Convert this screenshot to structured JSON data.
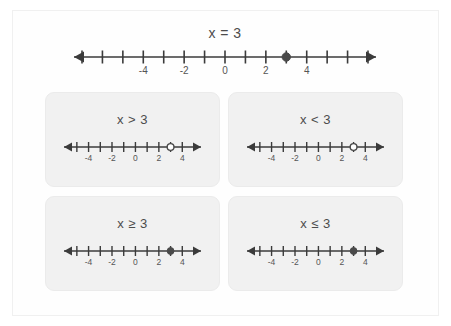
{
  "figure": {
    "title_equation": "x = 3",
    "background_color": "#ffffff",
    "frame_border_color": "#f0f0f0",
    "card_background_color": "#f1f1f1",
    "line_color": "#3b3b3b",
    "label_color": "#4c4c4c",
    "marker_fill_color": "#4a4a4a"
  },
  "chart_data": {
    "type": "line",
    "title": "x = 3",
    "xlabel": "",
    "ylabel": "",
    "plots": [
      {
        "id": "main-number-line",
        "label": "x = 3",
        "relation": "=",
        "value": 3,
        "xlim": [
          -7,
          7
        ],
        "ticks": [
          -7,
          -6,
          -5,
          -4,
          -3,
          -2,
          -1,
          0,
          1,
          2,
          3,
          4,
          5,
          6,
          7
        ],
        "tick_labels": [
          {
            "value": -4,
            "text": "-4"
          },
          {
            "value": -2,
            "text": "-2"
          },
          {
            "value": 0,
            "text": "0"
          },
          {
            "value": 2,
            "text": "2"
          },
          {
            "value": 4,
            "text": "4"
          }
        ],
        "markers": [
          {
            "at": 3,
            "style": "closed"
          }
        ],
        "arrows": [
          "left",
          "right"
        ],
        "shaded_ray": "none"
      },
      {
        "id": "line-greater-than",
        "label": "x > 3",
        "relation": ">",
        "value": 3,
        "xlim": [
          -5.5,
          5
        ],
        "ticks": [
          -5,
          -4,
          -3,
          -2,
          -1,
          0,
          1,
          2,
          3,
          4
        ],
        "tick_labels": [
          {
            "value": -4,
            "text": "-4"
          },
          {
            "value": -2,
            "text": "-2"
          },
          {
            "value": 0,
            "text": "0"
          },
          {
            "value": 2,
            "text": "2"
          },
          {
            "value": 4,
            "text": "4"
          }
        ],
        "markers": [
          {
            "at": 3,
            "style": "open"
          }
        ],
        "arrows": [
          "left",
          "right"
        ],
        "shaded_ray": "none"
      },
      {
        "id": "line-less-than",
        "label": "x < 3",
        "relation": "<",
        "value": 3,
        "xlim": [
          -5.5,
          5
        ],
        "ticks": [
          -5,
          -4,
          -3,
          -2,
          -1,
          0,
          1,
          2,
          3,
          4
        ],
        "tick_labels": [
          {
            "value": -4,
            "text": "-4"
          },
          {
            "value": -2,
            "text": "-2"
          },
          {
            "value": 0,
            "text": "0"
          },
          {
            "value": 2,
            "text": "2"
          },
          {
            "value": 4,
            "text": "4"
          }
        ],
        "markers": [
          {
            "at": 3,
            "style": "open"
          }
        ],
        "arrows": [
          "left",
          "right"
        ],
        "shaded_ray": "none"
      },
      {
        "id": "line-greater-equal",
        "label": "x ≥ 3",
        "relation": "≥",
        "value": 3,
        "xlim": [
          -5.5,
          5
        ],
        "ticks": [
          -5,
          -4,
          -3,
          -2,
          -1,
          0,
          1,
          2,
          3,
          4
        ],
        "tick_labels": [
          {
            "value": -4,
            "text": "-4"
          },
          {
            "value": -2,
            "text": "-2"
          },
          {
            "value": 0,
            "text": "0"
          },
          {
            "value": 2,
            "text": "2"
          },
          {
            "value": 4,
            "text": "4"
          }
        ],
        "markers": [
          {
            "at": 3,
            "style": "closed"
          }
        ],
        "arrows": [
          "left",
          "right"
        ],
        "shaded_ray": "none"
      },
      {
        "id": "line-less-equal",
        "label": "x ≤ 3",
        "relation": "≤",
        "value": 3,
        "xlim": [
          -5.5,
          5
        ],
        "ticks": [
          -5,
          -4,
          -3,
          -2,
          -1,
          0,
          1,
          2,
          3,
          4
        ],
        "tick_labels": [
          {
            "value": -4,
            "text": "-4"
          },
          {
            "value": -2,
            "text": "-2"
          },
          {
            "value": 0,
            "text": "0"
          },
          {
            "value": 2,
            "text": "2"
          },
          {
            "value": 4,
            "text": "4"
          }
        ],
        "markers": [
          {
            "at": 3,
            "style": "closed"
          }
        ],
        "arrows": [
          "left",
          "right"
        ],
        "shaded_ray": "none"
      }
    ]
  },
  "cards": [
    {
      "label": "x > 3",
      "plot_id": "line-greater-than"
    },
    {
      "label": "x < 3",
      "plot_id": "line-less-than"
    },
    {
      "label": "x ≥ 3",
      "plot_id": "line-greater-equal"
    },
    {
      "label": "x ≤ 3",
      "plot_id": "line-less-equal"
    }
  ]
}
